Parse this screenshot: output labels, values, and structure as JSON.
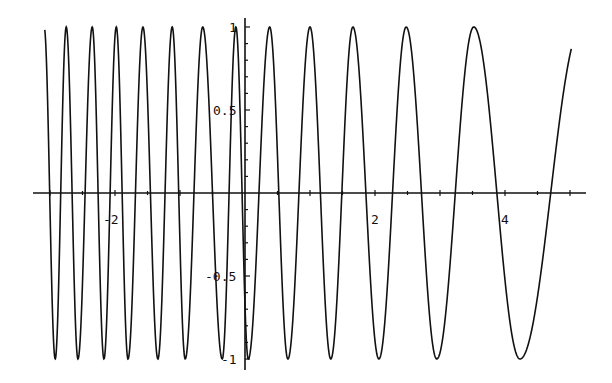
{
  "chart_data": {
    "type": "line",
    "title": "",
    "xlabel": "",
    "ylabel": "",
    "xlim": [
      -3.08,
      5.03
    ],
    "ylim": [
      -1,
      1
    ],
    "grid": false,
    "legend": null,
    "x_ticks": [
      {
        "value": -2,
        "label": "-2"
      },
      {
        "value": 2,
        "label": "2"
      },
      {
        "value": 4,
        "label": "4"
      }
    ],
    "y_ticks": [
      {
        "value": 1,
        "label": "1"
      },
      {
        "value": 0.5,
        "label": "0.5"
      },
      {
        "value": -0.5,
        "label": "-0.5"
      },
      {
        "value": -1,
        "label": "-1"
      }
    ],
    "series": [
      {
        "name": "oscillation with decreasing frequency",
        "color": "#111111",
        "x_start": -3.08,
        "y_start": 0.78,
        "x_end": 5.02,
        "y_end": 0.52,
        "peaks_x": [
          -2.75,
          -2.35,
          -1.98,
          -1.57,
          -1.12,
          -0.65,
          -0.14,
          0.38,
          1.0,
          1.66,
          2.48,
          3.52
        ],
        "troughs_x": [
          -2.92,
          -2.57,
          -2.17,
          -1.8,
          -1.34,
          -0.92,
          -0.35,
          0.05,
          0.66,
          1.32,
          2.06,
          2.95,
          4.23
        ]
      }
    ]
  },
  "axes": {
    "x_axis_color": "#111111",
    "y_axis_color": "#111111"
  }
}
